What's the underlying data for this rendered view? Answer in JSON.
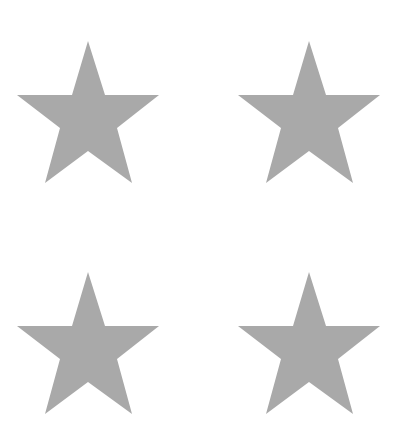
{
  "canvas": {
    "width": 406,
    "height": 436,
    "background": "#ffffff"
  },
  "shapes": {
    "fill_color": "#a9a9a9",
    "stars": [
      {
        "id": "star-top-left",
        "x": 12,
        "y": 36
      },
      {
        "id": "star-top-right",
        "x": 233,
        "y": 36
      },
      {
        "id": "star-bottom-left",
        "x": 12,
        "y": 267
      },
      {
        "id": "star-bottom-right",
        "x": 233,
        "y": 267
      }
    ]
  }
}
